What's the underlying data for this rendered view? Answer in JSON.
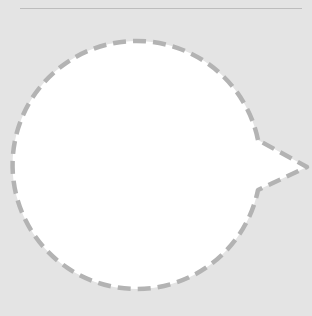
{
  "canvas": {
    "background": "#e4e4e4"
  },
  "divider": {
    "color": "#bdbdbd"
  },
  "shape": {
    "type": "speech-bubble",
    "fill": "#ffffff",
    "stroke": "#b3b3b3",
    "stroke_style": "dashed"
  }
}
